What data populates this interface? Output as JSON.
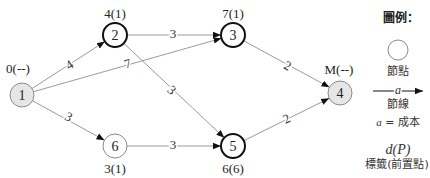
{
  "diagram": {
    "nodes": [
      {
        "id": "1",
        "label": "1",
        "tag": "0(--)"
      },
      {
        "id": "2",
        "label": "2",
        "tag": "4(1)"
      },
      {
        "id": "3",
        "label": "3",
        "tag": "7(1)"
      },
      {
        "id": "4",
        "label": "4",
        "tag": "M(--)"
      },
      {
        "id": "5",
        "label": "5",
        "tag": "6(6)"
      },
      {
        "id": "6",
        "label": "6",
        "tag": "3(1)"
      }
    ],
    "edges": [
      {
        "from": "1",
        "to": "2",
        "cost": "4"
      },
      {
        "from": "1",
        "to": "3",
        "cost": "7"
      },
      {
        "from": "1",
        "to": "6",
        "cost": "3"
      },
      {
        "from": "2",
        "to": "3",
        "cost": "3"
      },
      {
        "from": "2",
        "to": "5",
        "cost": "3"
      },
      {
        "from": "6",
        "to": "5",
        "cost": "3"
      },
      {
        "from": "3",
        "to": "4",
        "cost": "2"
      },
      {
        "from": "5",
        "to": "4",
        "cost": "2"
      }
    ],
    "colors": {
      "edge": "#9a9a9a",
      "arrowhead": "#111111",
      "node_fill_endpoint": "#e6e6e6",
      "node_stroke_bold": "#111111",
      "node_stroke_light": "#8a8a8a"
    }
  },
  "legend": {
    "title": "圖例：",
    "node_caption": "節點",
    "arc_symbol": "a",
    "arc_caption": "節線",
    "cost_var": "a",
    "cost_eq": " = 成本",
    "tag_symbol": "d(P)",
    "tag_caption": "標籤(前置點)"
  }
}
